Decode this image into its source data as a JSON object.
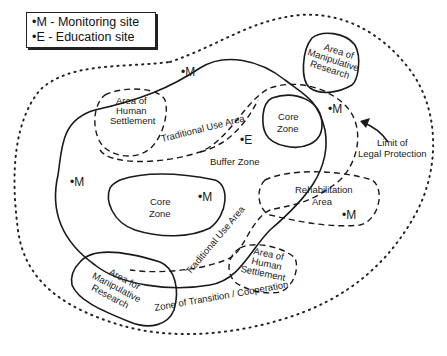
{
  "legend": {
    "items": [
      {
        "symbol": "•M",
        "label": "•M - Monitoring site"
      },
      {
        "symbol": "•E",
        "label": "•E - Education site"
      }
    ]
  },
  "zones": {
    "core_zone_1": "Core",
    "core_zone_1b": "Zone",
    "core_zone_2": "Core",
    "core_zone_2b": "Zone",
    "buffer_zone": "Buffer Zone",
    "transition_zone": "Zone of Transition / Cooperation",
    "traditional_use_1": "Traditional Use Area",
    "traditional_use_2": "Traditional Use Area",
    "rehab_1": "Rehabilitation",
    "rehab_2": "Area",
    "human_settlement_1": [
      "Area of",
      "Human",
      "Settlement"
    ],
    "human_settlement_2": [
      "Area of",
      "Human",
      "Settlement"
    ],
    "manipulative_research_1": [
      "Area of",
      "Manipulative",
      "Research"
    ],
    "manipulative_research_2": [
      "Area for",
      "Manipulative",
      "Research"
    ],
    "legal_limit_1": "Limit of",
    "legal_limit_2": "Legal Protection"
  },
  "markers": {
    "monitoring": "•M",
    "education": "•E"
  }
}
